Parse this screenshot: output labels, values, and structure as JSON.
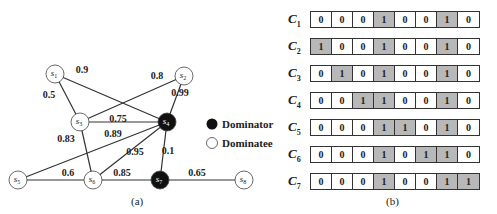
{
  "figure_a": {
    "caption": "(a)",
    "nodes": [
      {
        "id": "s1",
        "label": "s",
        "sub": "1",
        "x": 55,
        "y": 74,
        "type": "dominatee"
      },
      {
        "id": "s2",
        "label": "s",
        "sub": "2",
        "x": 184,
        "y": 76,
        "type": "dominatee"
      },
      {
        "id": "s3",
        "label": "s",
        "sub": "3",
        "x": 80,
        "y": 122,
        "type": "dominatee"
      },
      {
        "id": "s4",
        "label": "s",
        "sub": "4",
        "x": 167,
        "y": 122,
        "type": "dominator"
      },
      {
        "id": "s5",
        "label": "s",
        "sub": "5",
        "x": 18,
        "y": 180,
        "type": "dominatee"
      },
      {
        "id": "s6",
        "label": "s",
        "sub": "6",
        "x": 93,
        "y": 180,
        "type": "dominatee"
      },
      {
        "id": "s7",
        "label": "s",
        "sub": "7",
        "x": 160,
        "y": 180,
        "type": "dominator"
      },
      {
        "id": "s8",
        "label": "s",
        "sub": "8",
        "x": 244,
        "y": 180,
        "type": "dominatee"
      }
    ],
    "edges": [
      {
        "from": "s1",
        "to": "s4",
        "weight": "0.9",
        "lx": 82,
        "ly": 73
      },
      {
        "from": "s1",
        "to": "s3",
        "weight": "0.5",
        "lx": 49,
        "ly": 98
      },
      {
        "from": "s3",
        "to": "s2",
        "weight": "0.8",
        "lx": 157,
        "ly": 79
      },
      {
        "from": "s2",
        "to": "s4",
        "weight": "0.99",
        "lx": 180,
        "ly": 96
      },
      {
        "from": "s3",
        "to": "s4",
        "weight": "0.75",
        "lx": 118,
        "ly": 122
      },
      {
        "from": "s5",
        "to": "s4",
        "weight": "0.89",
        "lx": 113,
        "ly": 137
      },
      {
        "from": "s3",
        "to": "s6",
        "weight": "0.83",
        "lx": 66,
        "ly": 142
      },
      {
        "from": "s6",
        "to": "s4",
        "weight": "0.95",
        "lx": 135,
        "ly": 155
      },
      {
        "from": "s4",
        "to": "s7",
        "weight": "0.1",
        "lx": 168,
        "ly": 154
      },
      {
        "from": "s5",
        "to": "s6",
        "weight": "0.6",
        "lx": 68,
        "ly": 176
      },
      {
        "from": "s6",
        "to": "s7",
        "weight": "0.85",
        "lx": 122,
        "ly": 176
      },
      {
        "from": "s7",
        "to": "s8",
        "weight": "0.65",
        "lx": 197,
        "ly": 176
      }
    ],
    "legend": {
      "dominator_label": "Dominator",
      "dominatee_label": "Dominatee"
    }
  },
  "figure_b": {
    "caption": "(b)",
    "rows": [
      {
        "label": "C",
        "sub": "1",
        "bits": [
          0,
          0,
          0,
          1,
          0,
          0,
          1,
          0
        ]
      },
      {
        "label": "C",
        "sub": "2",
        "bits": [
          1,
          0,
          0,
          1,
          0,
          0,
          1,
          0
        ]
      },
      {
        "label": "C",
        "sub": "3",
        "bits": [
          0,
          1,
          0,
          1,
          0,
          0,
          1,
          0
        ]
      },
      {
        "label": "C",
        "sub": "4",
        "bits": [
          0,
          0,
          1,
          1,
          0,
          0,
          1,
          0
        ]
      },
      {
        "label": "C",
        "sub": "5",
        "bits": [
          0,
          0,
          0,
          1,
          1,
          0,
          1,
          0
        ]
      },
      {
        "label": "C",
        "sub": "6",
        "bits": [
          0,
          0,
          0,
          1,
          0,
          1,
          1,
          0
        ]
      },
      {
        "label": "C",
        "sub": "7",
        "bits": [
          0,
          0,
          0,
          1,
          0,
          0,
          1,
          1
        ]
      }
    ]
  },
  "colors": {
    "dominator_fill": "#111111",
    "dominatee_fill": "#ffffff",
    "edge": "#333333",
    "highlight_cell": "#b8b8b8"
  }
}
